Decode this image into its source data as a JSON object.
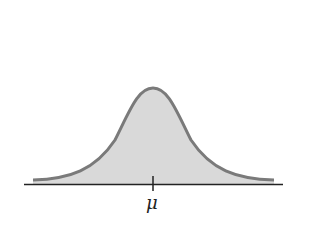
{
  "diagram": {
    "type": "normal-distribution-curve",
    "fill_color": "#d9d9d9",
    "curve_color": "#7a7a7a",
    "axis_color": "#222222",
    "mean_label": "μ"
  }
}
